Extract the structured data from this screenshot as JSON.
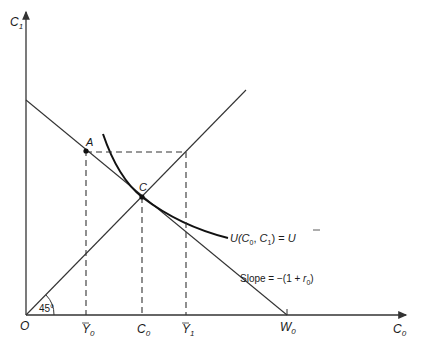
{
  "axes": {
    "y_label": "C",
    "y_sub": "1",
    "x_label": "C",
    "x_sub": "0",
    "origin": "O"
  },
  "points": {
    "A": "A",
    "C": "C"
  },
  "x_ticks": {
    "Y0": {
      "base": "Y",
      "sub": "0"
    },
    "C0": {
      "base": "C",
      "sub": "0"
    },
    "Y1": {
      "base": "Y",
      "sub": "1"
    },
    "W0": {
      "base": "W",
      "sub": "0"
    }
  },
  "angle_label": "45°",
  "curve_label": {
    "prefix": "U(",
    "c0": "C",
    "c0_sub": "0",
    "sep": ", ",
    "c1": "C",
    "c1_sub": "1",
    "suffix": ") = ",
    "ubar": "U"
  },
  "slope_label": {
    "prefix": "Slope = −(1 + ",
    "r": "r",
    "r_sub": "0",
    "suffix": ")"
  },
  "colors": {
    "line": "#333333",
    "curve": "#111111"
  }
}
